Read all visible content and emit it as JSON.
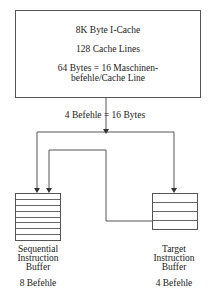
{
  "cache": {
    "title": "8K Byte I-Cache",
    "lines": "128 Cache Lines",
    "line_size_1": "64 Bytes = 16 Maschinen-",
    "line_size_2": "befehle/Cache Line"
  },
  "transfer_label": "4 Befehle = 16 Bytes",
  "sequential": {
    "name_1": "Sequential",
    "name_2": "Instruction",
    "name_3": "Buffer",
    "capacity": "8 Befehle",
    "rows": 8
  },
  "target": {
    "name_1": "Target",
    "name_2": "Instruction",
    "name_3": "Buffer",
    "capacity": "4 Befehle",
    "rows": 4
  }
}
